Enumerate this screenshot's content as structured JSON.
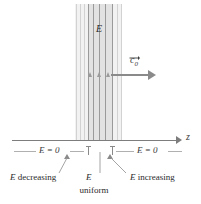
{
  "figure": {
    "type": "physics-field-diagram"
  },
  "band": {
    "field_label": "E"
  },
  "vector": {
    "symbol": "c",
    "subscript": "0",
    "notation": "vector-arrow-overset",
    "direction": "right"
  },
  "axis": {
    "label": "z",
    "direction": "right"
  },
  "regions": {
    "left_zero": "E = 0",
    "right_zero": "E = 0"
  },
  "captions": {
    "left": {
      "italic": "E",
      "text": " decreasing"
    },
    "center": {
      "italic": "E",
      "line2": "uniform"
    },
    "right": {
      "italic": "E",
      "text": " increasing"
    }
  },
  "colors": {
    "band_outer": "#f2f2f2",
    "band_inner": "#e2e2e2",
    "stroke": "#8a8a8a",
    "text": "#2b2b2b",
    "background": "#ffffff"
  }
}
